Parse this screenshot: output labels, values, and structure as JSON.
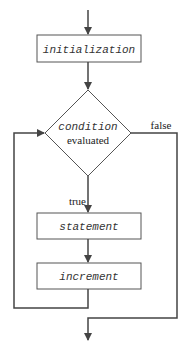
{
  "diagram": {
    "nodes": {
      "initialization": {
        "label": "initialization"
      },
      "condition": {
        "label_line1": "condition",
        "label_line2": "evaluated"
      },
      "statement": {
        "label": "statement"
      },
      "increment": {
        "label": "increment"
      }
    },
    "edges": {
      "true_label": "true",
      "false_label": "false"
    },
    "colors": {
      "stroke": "#444444",
      "text": "#333333",
      "background": "#ffffff"
    }
  }
}
